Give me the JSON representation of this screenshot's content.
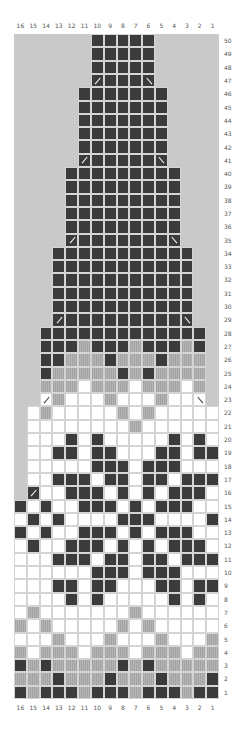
{
  "chart_title": "",
  "legend": {
    "D": "dark contrast color",
    "G": "medium gray color",
    "W": "white / background color",
    "/": "left-leaning decrease",
    "\\": "right-leaning decrease",
    ".": "no stitch"
  },
  "colors": {
    "dark": "#3b3b3b",
    "gray": "#a8a8a8",
    "white": "#ffffff",
    "no_stitch": "#c9c9c9",
    "grid": "#d4d4d4"
  },
  "columns": [
    "16",
    "15",
    "14",
    "13",
    "12",
    "11",
    "10",
    "9",
    "8",
    "7",
    "6",
    "5",
    "4",
    "3",
    "2",
    "1"
  ],
  "rows": [
    {
      "n": "50",
      "cells": "......DDDDD....."
    },
    {
      "n": "49",
      "cells": "......DDDDD....."
    },
    {
      "n": "48",
      "cells": "......DDDDD....."
    },
    {
      "n": "47",
      "cells": "......aDDDb....."
    },
    {
      "n": "46",
      "cells": ".....DDDDDDD...."
    },
    {
      "n": "45",
      "cells": ".....DDDDDDD...."
    },
    {
      "n": "44",
      "cells": ".....DDDDDDD...."
    },
    {
      "n": "43",
      "cells": ".....DDDDDDD...."
    },
    {
      "n": "42",
      "cells": ".....DDDDDDD...."
    },
    {
      "n": "41",
      "cells": ".....aDDDDDb...."
    },
    {
      "n": "40",
      "cells": "....DDDDDDDDD..."
    },
    {
      "n": "39",
      "cells": "....DDDDDDDDD..."
    },
    {
      "n": "38",
      "cells": "....DDDDDDDDD..."
    },
    {
      "n": "37",
      "cells": "....DDDDDDDDD..."
    },
    {
      "n": "36",
      "cells": "....DDDDDDDDD..."
    },
    {
      "n": "35",
      "cells": "....aDDDDDDDb..."
    },
    {
      "n": "34",
      "cells": "...DDDDDDDDDDD.."
    },
    {
      "n": "33",
      "cells": "...DDDDDDDDDDD.."
    },
    {
      "n": "32",
      "cells": "...DDDDDDDDDDD.."
    },
    {
      "n": "31",
      "cells": "...DDDDDDDDDDD.."
    },
    {
      "n": "30",
      "cells": "...DDDDDDDDDDD.."
    },
    {
      "n": "29",
      "cells": "...aDDDDDDDDDb.."
    },
    {
      "n": "28",
      "cells": "..DDDDDDDDDDDDD."
    },
    {
      "n": "27",
      "cells": "..DDDGDDDGDDDGD."
    },
    {
      "n": "26",
      "cells": "..DDGGGDGGGDGGG."
    },
    {
      "n": "25",
      "cells": "..DGGGGGDGDGGGG."
    },
    {
      "n": "24",
      "cells": "..GGGWGGGWGGGWG."
    },
    {
      "n": "23",
      "cells": "..cGWWWGWWWGWWd."
    },
    {
      "n": "22",
      "cells": ".WGWWWWWGWGWWWWW"
    },
    {
      "n": "21",
      "cells": ".WWWWWWWWGWWWWWW"
    },
    {
      "n": "20",
      "cells": ".WWWDWDWWWWWDWDW"
    },
    {
      "n": "19",
      "cells": ".WWDDWDDWWWDDWDD"
    },
    {
      "n": "18",
      "cells": ".WWWWWDDDWDDDWWW"
    },
    {
      "n": "17",
      "cells": ".WWDDDWDDWDDWDDD"
    },
    {
      "n": "16",
      "cells": ".aWWDDDWDWDWDDDW"
    },
    {
      "n": "15",
      "cells": "DWDWWDDDWDWDDDWW"
    },
    {
      "n": "14",
      "cells": "WDWDWWWWDDDWWWWD"
    },
    {
      "n": "13",
      "cells": "DWDWWDDDWDWDDDWW"
    },
    {
      "n": "12",
      "cells": "WDWWDDDWDWDWDDDW"
    },
    {
      "n": "11",
      "cells": "WWWDDDWDDWDDWDDD"
    },
    {
      "n": "10",
      "cells": "WWWWWWDDDWDDDWWW"
    },
    {
      "n": "9",
      "cells": "WWWDDWDDWWWDDWDD"
    },
    {
      "n": "8",
      "cells": "WWWWDWDWWWWWDWDW"
    },
    {
      "n": "7",
      "cells": "WGWWWWWWWGWWWWWW"
    },
    {
      "n": "6",
      "cells": "GWGWWWWWGWGWWWWW"
    },
    {
      "n": "5",
      "cells": "WWWGWWWGWWWGWWWG"
    },
    {
      "n": "4",
      "cells": "GWGGGWGGGWGGGWGG"
    },
    {
      "n": "3",
      "cells": "DGDGGGGGDGDGGGGG"
    },
    {
      "n": "2",
      "cells": "GGGDGGGDGGGDGGGD"
    },
    {
      "n": "1",
      "cells": "DGDDDGDDDGDDDGDD"
    }
  ],
  "cell_codes": {
    "a": "dark cell with left-leaning decrease",
    "b": "dark cell with right-leaning decrease",
    "c": "white cell with left-leaning decrease",
    "d": "white cell with right-leaning decrease"
  }
}
